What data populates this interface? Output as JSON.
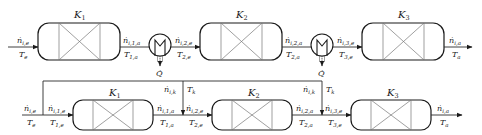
{
  "diagram": {
    "type": "process-flow",
    "top_row": {
      "reactors": [
        {
          "id": "K1",
          "label": "K",
          "sub": "1"
        },
        {
          "id": "K2",
          "label": "K",
          "sub": "2"
        },
        {
          "id": "K3",
          "label": "K",
          "sub": "3"
        }
      ],
      "heat_exchangers": [
        {
          "id": "HX1",
          "heat_label": "Q̇"
        },
        {
          "id": "HX2",
          "heat_label": "Q̇"
        }
      ],
      "streams": [
        {
          "flow": "ṅ",
          "flow_sub": "i,e",
          "temp": "T",
          "temp_sub": "e"
        },
        {
          "flow": "ṅ",
          "flow_sub": "i,1,a",
          "temp": "T",
          "temp_sub": "1,a"
        },
        {
          "flow": "ṅ",
          "flow_sub": "i,2,e",
          "temp": "T",
          "temp_sub": "2,e"
        },
        {
          "flow": "ṅ",
          "flow_sub": "i,2,a",
          "temp": "T",
          "temp_sub": "2,a"
        },
        {
          "flow": "ṅ",
          "flow_sub": "i,3,e",
          "temp": "T",
          "temp_sub": "3,e"
        },
        {
          "flow": "ṅ",
          "flow_sub": "i,a",
          "temp": "T",
          "temp_sub": "a"
        }
      ]
    },
    "bottom_row": {
      "reactors": [
        {
          "id": "K1",
          "label": "K",
          "sub": "1"
        },
        {
          "id": "K2",
          "label": "K",
          "sub": "2"
        },
        {
          "id": "K3",
          "label": "K",
          "sub": "3"
        }
      ],
      "inlet": {
        "flow": "ṅ",
        "flow_sub": "i,e",
        "temp": "T",
        "temp_sub": "e"
      },
      "reactor_inlet_1": {
        "flow": "ṅ",
        "flow_sub": "i,1,e",
        "temp": "T",
        "temp_sub": "1,e"
      },
      "outlet_1": {
        "flow": "ṅ",
        "flow_sub": "i,1,a",
        "temp": "T",
        "temp_sub": "1,a"
      },
      "quench_1": {
        "flow": "ṅ",
        "flow_sub": "i,k",
        "temp": "T",
        "temp_sub": "k"
      },
      "reactor_inlet_2": {
        "flow": "ṅ",
        "flow_sub": "i,2,e",
        "temp": "T",
        "temp_sub": "2,e"
      },
      "outlet_2": {
        "flow": "ṅ",
        "flow_sub": "i,2,a",
        "temp": "T",
        "temp_sub": "2,a"
      },
      "quench_2": {
        "flow": "ṅ",
        "flow_sub": "i,k",
        "temp": "T",
        "temp_sub": "k"
      },
      "reactor_inlet_3": {
        "flow": "ṅ",
        "flow_sub": "i,3,e",
        "temp": "T",
        "temp_sub": "3,e"
      },
      "outlet": {
        "flow": "ṅ",
        "flow_sub": "i,a",
        "temp": "T",
        "temp_sub": "a"
      }
    }
  }
}
